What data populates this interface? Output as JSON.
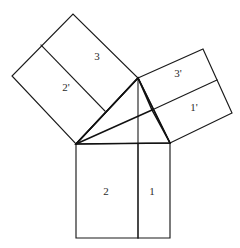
{
  "figure": {
    "background_color": "#ffffff",
    "line_color": "#1a1a1a",
    "label_color": "#2b2b2b",
    "canvas": {
      "width": 240,
      "height": 248
    }
  },
  "triangle": {
    "name": "right-triangle",
    "vertices": {
      "left": [
        76,
        144
      ],
      "right": [
        170,
        143
      ],
      "apex": [
        138,
        78
      ]
    },
    "edges_path": "M76,144 L170,143 L138,78 Z"
  },
  "squares": [
    {
      "id": "hypotenuse-square",
      "name": "bottom-square",
      "path": "M76,144 L170,143 L170,238 L76,238 Z",
      "divider_path": "M138,143.5 L138,238",
      "regions": [
        {
          "label": "2",
          "x": 106,
          "y": 192
        },
        {
          "label": "1",
          "x": 152,
          "y": 192
        }
      ]
    },
    {
      "id": "left-leg-square",
      "name": "upper-left-square",
      "path": "M76,144 L138,78 L73,14 L12,76 Z",
      "divider_path": "M105,111 L41,45",
      "regions": [
        {
          "label": "2'",
          "x": 66,
          "y": 88
        },
        {
          "label": "3",
          "x": 97,
          "y": 57
        }
      ]
    },
    {
      "id": "right-leg-square",
      "name": "upper-right-square",
      "path": "M138,78 L203,49 L232,113 L170,143 Z",
      "divider_path": "M152,110 L217,80",
      "regions": [
        {
          "label": "3'",
          "x": 178,
          "y": 74
        },
        {
          "label": "1'",
          "x": 194,
          "y": 108
        }
      ]
    }
  ],
  "construction_lines": [
    {
      "id": "apex-altitude",
      "name": "vertical-cevian-from-apex",
      "path": "M138,78 L138,238",
      "kind": "divider"
    },
    {
      "id": "left-vertex-to-foot",
      "name": "cevian-left-to-inner-point",
      "path": "M76,144 L152,110",
      "kind": "cevian"
    },
    {
      "id": "left-vertex-to-divider",
      "name": "cevian-left-to-square-divider",
      "path": "M76,144 L138,78",
      "kind": "cevian"
    },
    {
      "id": "inner-point-to-apex",
      "name": "cevian-inner-point-to-apex",
      "path": "M152,110 L138,78",
      "kind": "cevian"
    },
    {
      "id": "inner-point-to-right",
      "name": "cevian-inner-point-to-right-vertex",
      "path": "M152,110 L170,143",
      "kind": "cevian"
    },
    {
      "id": "left-square-divider-extension",
      "name": "left-square-inner-divider",
      "path": "M105,111 L41,45",
      "kind": "divider"
    }
  ],
  "labels": {
    "bottom_left": "2",
    "bottom_right": "1",
    "left_lower": "2'",
    "left_upper": "3",
    "right_upper": "3'",
    "right_lower": "1'"
  }
}
